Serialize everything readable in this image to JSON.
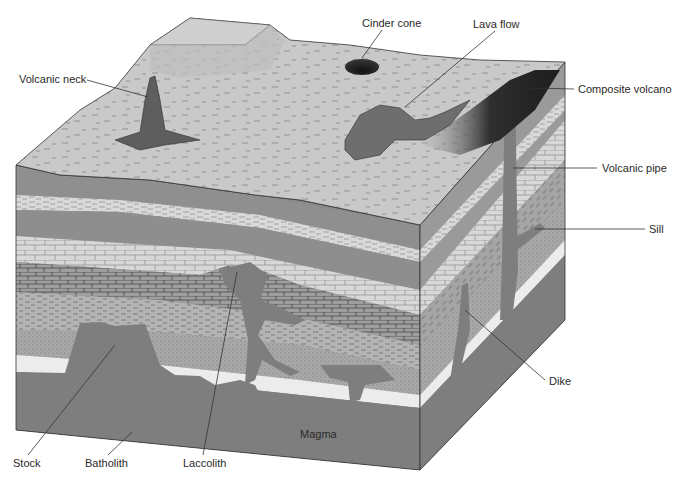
{
  "diagram": {
    "type": "geological block diagram",
    "labels": {
      "volcanic_neck": "Volcanic neck",
      "cinder_cone": "Cinder cone",
      "lava_flow": "Lava flow",
      "composite_volcano": "Composite volcano",
      "volcanic_pipe": "Volcanic pipe",
      "sill": "Sill",
      "dike": "Dike",
      "magma": "Magma",
      "stock": "Stock",
      "batholith": "Batholith",
      "laccolith": "Laccolith"
    },
    "colors": {
      "surface": "#c8c8c8",
      "dark_layer": "#8f8f8f",
      "light_layer": "#dcdcdc",
      "limestone": "#d6d6d6",
      "brick_dark": "#9c9c9c",
      "shale": "#b0b0b0",
      "sandstone": "#a8a8a8",
      "white_layer": "#ececec",
      "magma": "#7e7e7e",
      "right_face": "#9a9a9a",
      "volcano_dark": "#2a2a2a",
      "line": "#333333"
    }
  }
}
